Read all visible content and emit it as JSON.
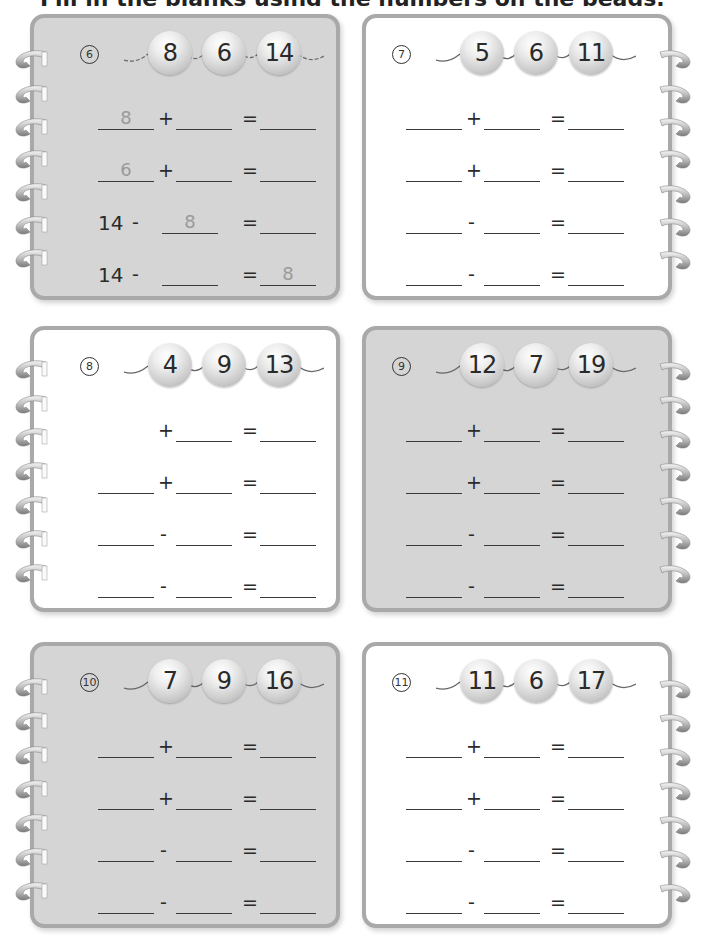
{
  "page": {
    "heading_cut": "Fill in the blanks using the numbers on the beads."
  },
  "exercises": [
    {
      "number": "6",
      "shade": "gray",
      "beads": [
        "8",
        "6",
        "14"
      ],
      "equations": [
        {
          "type": "add",
          "blank1": "8",
          "op": "+",
          "blank2": "",
          "eq": "=",
          "result": ""
        },
        {
          "type": "add",
          "blank1": "6",
          "op": "+",
          "blank2": "",
          "eq": "=",
          "result": ""
        },
        {
          "type": "sub_given",
          "given": "14",
          "op": "-",
          "blank2": "8",
          "eq": "=",
          "result": ""
        },
        {
          "type": "sub_given",
          "given": "14",
          "op": "-",
          "blank2": "",
          "eq": "=",
          "result": "8"
        }
      ]
    },
    {
      "number": "7",
      "shade": "white",
      "beads": [
        "5",
        "6",
        "11"
      ],
      "equations": [
        {
          "type": "add",
          "blank1": "",
          "op": "+",
          "blank2": "",
          "eq": "=",
          "result": ""
        },
        {
          "type": "add",
          "blank1": "",
          "op": "+",
          "blank2": "",
          "eq": "=",
          "result": ""
        },
        {
          "type": "sub",
          "blank1": "",
          "op": "-",
          "blank2": "",
          "eq": "=",
          "result": ""
        },
        {
          "type": "sub",
          "blank1": "",
          "op": "-",
          "blank2": "",
          "eq": "=",
          "result": ""
        }
      ]
    },
    {
      "number": "8",
      "shade": "white",
      "beads": [
        "4",
        "9",
        "13"
      ],
      "equations": [
        {
          "type": "add_noblank1",
          "blank1": "",
          "op": "+",
          "blank2": "",
          "eq": "=",
          "result": ""
        },
        {
          "type": "add",
          "blank1": "",
          "op": "+",
          "blank2": "",
          "eq": "=",
          "result": ""
        },
        {
          "type": "sub",
          "blank1": "",
          "op": "-",
          "blank2": "",
          "eq": "=",
          "result": ""
        },
        {
          "type": "sub",
          "blank1": "",
          "op": "-",
          "blank2": "",
          "eq": "=",
          "result": ""
        }
      ]
    },
    {
      "number": "9",
      "shade": "gray",
      "beads": [
        "12",
        "7",
        "19"
      ],
      "equations": [
        {
          "type": "add",
          "blank1": "",
          "op": "+",
          "blank2": "",
          "eq": "=",
          "result": ""
        },
        {
          "type": "add",
          "blank1": "",
          "op": "+",
          "blank2": "",
          "eq": "=",
          "result": ""
        },
        {
          "type": "sub",
          "blank1": "",
          "op": "-",
          "blank2": "",
          "eq": "=",
          "result": ""
        },
        {
          "type": "sub",
          "blank1": "",
          "op": "-",
          "blank2": "",
          "eq": "=",
          "result": ""
        }
      ]
    },
    {
      "number": "10",
      "shade": "gray",
      "beads": [
        "7",
        "9",
        "16"
      ],
      "equations": [
        {
          "type": "add",
          "blank1": "",
          "op": "+",
          "blank2": "",
          "eq": "=",
          "result": ""
        },
        {
          "type": "add",
          "blank1": "",
          "op": "+",
          "blank2": "",
          "eq": "=",
          "result": ""
        },
        {
          "type": "sub",
          "blank1": "",
          "op": "-",
          "blank2": "",
          "eq": "=",
          "result": ""
        },
        {
          "type": "sub",
          "blank1": "",
          "op": "-",
          "blank2": "",
          "eq": "=",
          "result": ""
        }
      ]
    },
    {
      "number": "11",
      "shade": "white",
      "beads": [
        "11",
        "6",
        "17"
      ],
      "equations": [
        {
          "type": "add",
          "blank1": "",
          "op": "+",
          "blank2": "",
          "eq": "=",
          "result": ""
        },
        {
          "type": "add",
          "blank1": "",
          "op": "+",
          "blank2": "",
          "eq": "=",
          "result": ""
        },
        {
          "type": "sub",
          "blank1": "",
          "op": "-",
          "blank2": "",
          "eq": "=",
          "result": ""
        },
        {
          "type": "sub",
          "blank1": "",
          "op": "-",
          "blank2": "",
          "eq": "=",
          "result": ""
        }
      ]
    }
  ],
  "colors": {
    "gray_panel": "#d5d5d5",
    "white_panel": "#ffffff",
    "panel_border": "#a9a9a9",
    "hint_digit": "#9a9a9a",
    "text": "#2a2a2a"
  }
}
